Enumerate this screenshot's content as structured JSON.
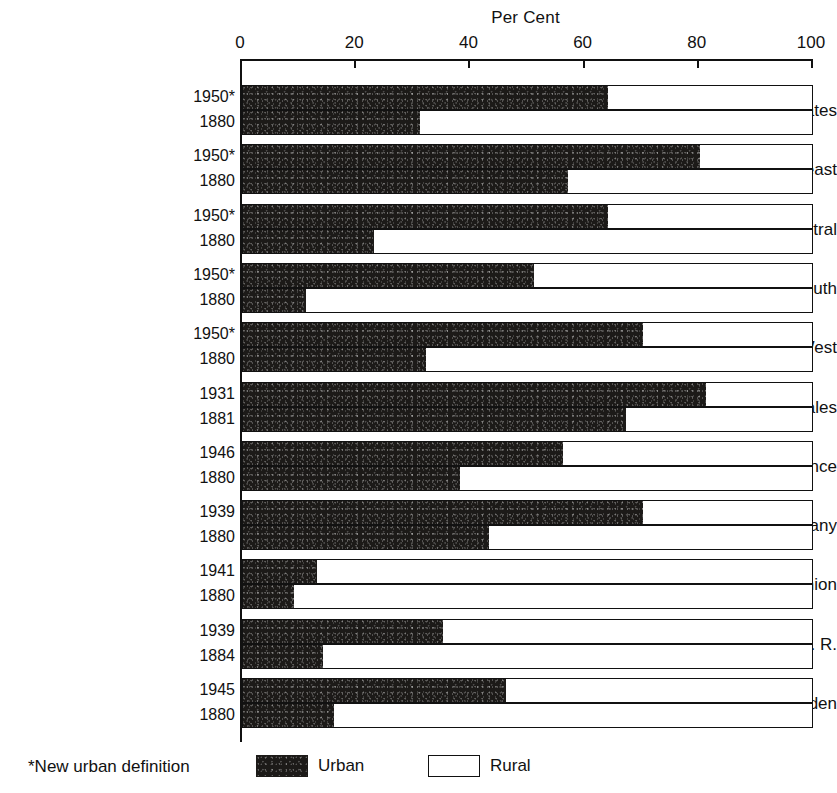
{
  "chart_data": {
    "type": "bar",
    "orientation": "horizontal",
    "stacked": true,
    "title": "Per Cent",
    "xlabel": "Per Cent",
    "ylabel": "",
    "xlim": [
      0,
      100
    ],
    "ticks": [
      0,
      20,
      40,
      60,
      80,
      100
    ],
    "tick_labels": [
      "0",
      "20",
      "40",
      "60",
      "80",
      "100"
    ],
    "grid": false,
    "legend_position": "bottom",
    "series": [
      {
        "name": "Urban",
        "color": "#1c1a18"
      },
      {
        "name": "Rural",
        "color": "#ffffff"
      }
    ],
    "categories": [
      "United States",
      "Northeast",
      "North Central",
      "South",
      "West",
      "England & Wales",
      "France",
      "Germany",
      "Indian Union",
      "U. S. S. R.",
      "Sweden"
    ],
    "groups": [
      {
        "region": "United States",
        "rows": [
          {
            "year": "1950*",
            "urban": 64,
            "rural": 36
          },
          {
            "year": "1880",
            "urban": 31,
            "rural": 69
          }
        ]
      },
      {
        "region": "Northeast",
        "rows": [
          {
            "year": "1950*",
            "urban": 80,
            "rural": 20
          },
          {
            "year": "1880",
            "urban": 57,
            "rural": 43
          }
        ]
      },
      {
        "region": "North Central",
        "rows": [
          {
            "year": "1950*",
            "urban": 64,
            "rural": 36
          },
          {
            "year": "1880",
            "urban": 23,
            "rural": 77
          }
        ]
      },
      {
        "region": "South",
        "rows": [
          {
            "year": "1950*",
            "urban": 51,
            "rural": 49
          },
          {
            "year": "1880",
            "urban": 11,
            "rural": 89
          }
        ]
      },
      {
        "region": "West",
        "rows": [
          {
            "year": "1950*",
            "urban": 70,
            "rural": 30
          },
          {
            "year": "1880",
            "urban": 32,
            "rural": 68
          }
        ]
      },
      {
        "region": "England & Wales",
        "rows": [
          {
            "year": "1931",
            "urban": 81,
            "rural": 19
          },
          {
            "year": "1881",
            "urban": 67,
            "rural": 33
          }
        ]
      },
      {
        "region": "France",
        "rows": [
          {
            "year": "1946",
            "urban": 56,
            "rural": 44
          },
          {
            "year": "1880",
            "urban": 38,
            "rural": 62
          }
        ]
      },
      {
        "region": "Germany",
        "rows": [
          {
            "year": "1939",
            "urban": 70,
            "rural": 30
          },
          {
            "year": "1880",
            "urban": 43,
            "rural": 57
          }
        ]
      },
      {
        "region": "Indian Union",
        "rows": [
          {
            "year": "1941",
            "urban": 13,
            "rural": 87
          },
          {
            "year": "1880",
            "urban": 9,
            "rural": 91
          }
        ]
      },
      {
        "region": "U. S. S. R.",
        "rows": [
          {
            "year": "1939",
            "urban": 35,
            "rural": 65
          },
          {
            "year": "1884",
            "urban": 14,
            "rural": 86
          }
        ]
      },
      {
        "region": "Sweden",
        "rows": [
          {
            "year": "1945",
            "urban": 46,
            "rural": 54
          },
          {
            "year": "1880",
            "urban": 16,
            "rural": 84
          }
        ]
      }
    ],
    "footnote": "*New urban definition",
    "legend_labels": [
      "Urban",
      "Rural"
    ]
  }
}
